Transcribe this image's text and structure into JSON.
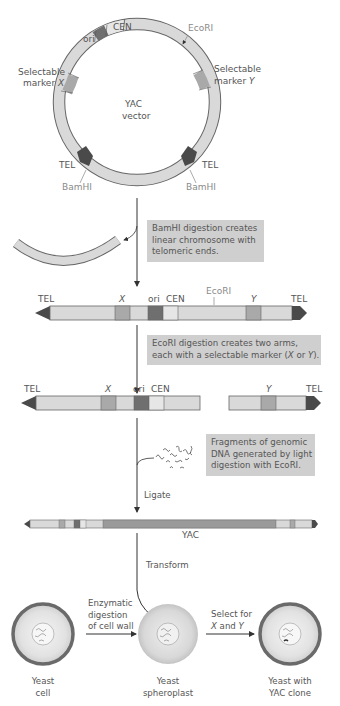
{
  "circle": {
    "center_label_1": "YAC",
    "center_label_2": "vector",
    "labels": {
      "cen": "CEN",
      "ori": "ori",
      "ecori": "EcoRI",
      "marker_x_1": "Selectable",
      "marker_x_2": "marker ",
      "marker_x_letter": "X",
      "marker_y_1": "Selectable",
      "marker_y_2": "marker ",
      "marker_y_letter": "Y",
      "tel_left": "TEL",
      "tel_right": "TEL",
      "bamhi_left": "BamHI",
      "bamhi_right": "BamHI"
    }
  },
  "step1": {
    "note_lines": [
      "BamHI digestion creates",
      "linear chromosome with",
      "telomeric ends."
    ]
  },
  "linear1": {
    "labels": {
      "tel_left": "TEL",
      "x": "X",
      "ori": "ori",
      "cen": "CEN",
      "ecori": "EcoRI",
      "y": "Y",
      "tel_right": "TEL"
    }
  },
  "step2": {
    "note_line1": "EcoRI digestion creates two arms,",
    "note_line2_a": "each with a selectable marker (",
    "note_line2_x": "X",
    "note_line2_or": " or ",
    "note_line2_y": "Y",
    "note_line2_end": ")."
  },
  "arms": {
    "labels": {
      "tel_left": "TEL",
      "x": "X",
      "ori": "ori",
      "cen": "CEN",
      "y": "Y",
      "tel_right": "TEL"
    }
  },
  "step3": {
    "note_lines": [
      "Fragments of genomic",
      "DNA generated by light",
      "digestion with EcoRI."
    ],
    "ligate_label": "Ligate"
  },
  "yac": {
    "label": "YAC"
  },
  "step4": {
    "transform_label": "Transform"
  },
  "cells": {
    "cell1_lines": [
      "Yeast",
      "cell"
    ],
    "arrow1_lines": [
      "Enzymatic",
      "digestion",
      "of cell wall"
    ],
    "cell2_lines": [
      "Yeast",
      "spheroplast"
    ],
    "arrow2_line1": "Select for",
    "arrow2_line2_x": "X",
    "arrow2_line2_and": " and ",
    "arrow2_line2_y": "Y",
    "cell3_lines": [
      "Yeast with",
      "YAC clone"
    ]
  },
  "colors": {
    "segment_light": "#d9d9d9",
    "segment_mid": "#a9a9a9",
    "segment_dark": "#6f6f6f",
    "telomere": "#4a4a4a",
    "note_bg": "#cfcfcf",
    "cell_wall": "#6a6a6a",
    "genomic_insert": "#9a9a9a"
  }
}
